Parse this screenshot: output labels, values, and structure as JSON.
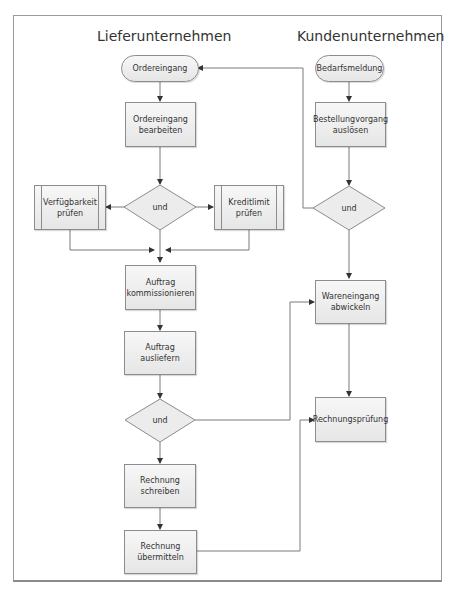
{
  "lanes": {
    "supplier": "Lieferunternehmen",
    "customer": "Kundenunternehmen"
  },
  "nodes": {
    "ordereingang": "Ordereingang",
    "ordereingang_bearbeiten": "Ordereingang\nbearbeiten",
    "und_1": "und",
    "verfuegbarkeit": "Verfügbarkeit\nprüfen",
    "kreditlimit": "Kreditlimit\nprüfen",
    "auftrag_kommissionieren": "Auftrag\nkommissionieren",
    "auftrag_ausliefern": "Auftrag\nausliefern",
    "und_2": "und",
    "rechnung_schreiben": "Rechnung\nschreiben",
    "rechnung_uebermitteln": "Rechnung\nübermitteln",
    "bedarfsmeldung": "Bedarfsmeldung",
    "bestellungvorgang": "Bestellungvorgang\nauslösen",
    "und_3": "und",
    "wareneingang": "Wareneingang\nabwickeln",
    "rechnungspruefung": "Rechnungsprüfung"
  },
  "colors": {
    "node_fill_top": "#f7f7f7",
    "node_fill_bottom": "#e6e6e6",
    "node_border": "#8c8c8c",
    "edge": "#7a7a7a",
    "arrow": "#333333"
  }
}
